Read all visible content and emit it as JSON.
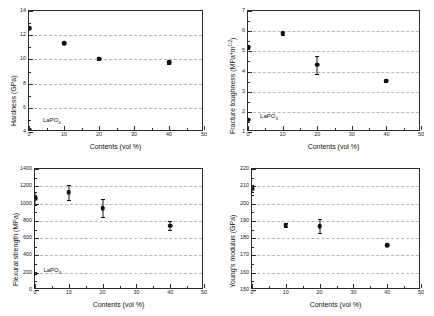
{
  "figure": {
    "x_axis_title": "Contents (vol %)",
    "x_ticks": [
      "0",
      "10",
      "20",
      "30",
      "40",
      "50"
    ],
    "annotation_label": "LaPO",
    "annotation_sub": "4"
  },
  "chart_data": [
    {
      "id": "hardness",
      "type": "scatter",
      "title": "",
      "xlabel": "Contents (vol %)",
      "ylabel": "Hardness (GPa)",
      "xlim": [
        0,
        50
      ],
      "ylim": [
        4,
        14
      ],
      "xticks": [
        0,
        10,
        20,
        30,
        40,
        50
      ],
      "yticks": [
        4,
        6,
        8,
        10,
        12,
        14
      ],
      "ytick_labels": [
        "4",
        "6",
        "8",
        "10",
        "12",
        "14"
      ],
      "grid": true,
      "grid_values": [
        6,
        8,
        10,
        12
      ],
      "legend": "none",
      "x": [
        0,
        10,
        20,
        40
      ],
      "values": [
        12.6,
        11.35,
        10.05,
        9.75
      ],
      "errors": [
        0,
        0,
        0.12,
        0.15
      ],
      "annotation": {
        "text": "LaPO4",
        "x": 0,
        "y": 4.2,
        "marker": "circle",
        "label_x": 4,
        "label_y": 4.95
      }
    },
    {
      "id": "fracture-toughness",
      "type": "scatter",
      "title": "",
      "xlabel": "Contents (vol %)",
      "ylabel": "Fracture toughness (MPa*m^1/2)",
      "xlim": [
        0,
        50
      ],
      "ylim": [
        1,
        7
      ],
      "xticks": [
        0,
        10,
        20,
        30,
        40,
        50
      ],
      "yticks": [
        1,
        2,
        3,
        4,
        5,
        6,
        7
      ],
      "ytick_labels": [
        "1",
        "2",
        "3",
        "4",
        "5",
        "6",
        "7"
      ],
      "grid": true,
      "grid_values": [
        2,
        3,
        4,
        5,
        6
      ],
      "legend": "none",
      "x": [
        0,
        10,
        20,
        40
      ],
      "values": [
        5.2,
        5.9,
        4.33,
        3.55
      ],
      "errors": [
        0.08,
        0.08,
        0.45,
        0.05
      ],
      "annotation": {
        "text": "LaPO4",
        "x": 0,
        "y": 1.6,
        "marker": "circle",
        "label_x": 3.5,
        "label_y": 1.72
      }
    },
    {
      "id": "flexural-strength",
      "type": "scatter",
      "title": "",
      "xlabel": "Contents (vol %)",
      "ylabel": "Flexural strength (MPa)",
      "xlim": [
        0,
        50
      ],
      "ylim": [
        0,
        1400
      ],
      "xticks": [
        0,
        10,
        20,
        30,
        40,
        50
      ],
      "yticks": [
        0,
        200,
        400,
        600,
        800,
        1000,
        1200,
        1400
      ],
      "ytick_labels": [
        "0",
        "200",
        "400",
        "600",
        "800",
        "1000",
        "1200",
        "1400"
      ],
      "grid": true,
      "grid_values": [
        200,
        400,
        600,
        800,
        1000,
        1200
      ],
      "legend": "none",
      "x": [
        0,
        10,
        20,
        40
      ],
      "values": [
        1060,
        1130,
        945,
        745
      ],
      "errors": [
        75,
        85,
        105,
        50
      ],
      "annotation": {
        "text": "LaPO4",
        "x": 0,
        "y": 190,
        "marker": "square",
        "label_x": 2.5,
        "label_y": 215
      }
    },
    {
      "id": "youngs-modulus",
      "type": "scatter",
      "title": "",
      "xlabel": "Contents (vol %)",
      "ylabel": "Young's modulus (GPa)",
      "xlim": [
        0,
        50
      ],
      "ylim": [
        150,
        220
      ],
      "xticks": [
        0,
        10,
        20,
        30,
        40,
        50
      ],
      "yticks": [
        150,
        160,
        170,
        180,
        190,
        200,
        210,
        220
      ],
      "ytick_labels": [
        "150",
        "160",
        "170",
        "180",
        "190",
        "200",
        "210",
        "220"
      ],
      "grid": true,
      "grid_values": [
        160,
        170,
        180,
        190,
        200,
        210
      ],
      "legend": "none",
      "x": [
        0,
        10,
        20,
        40
      ],
      "values": [
        208.5,
        187.5,
        187.0,
        176.0
      ],
      "errors": [
        2.0,
        1.2,
        4.0,
        0
      ],
      "annotation": null
    }
  ]
}
